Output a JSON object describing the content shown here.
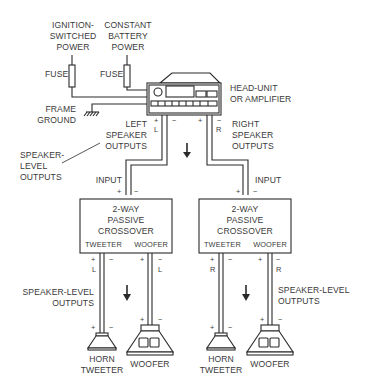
{
  "colors": {
    "line": "#2a2a2a",
    "text": "#3a3a3a",
    "background": "#ffffff"
  },
  "power": {
    "ignition": {
      "line1": "IGNITION-",
      "line2": "SWITCHED",
      "line3": "POWER",
      "fuse_label": "FUSE"
    },
    "constant": {
      "line1": "CONSTANT",
      "line2": "BATTERY",
      "line3": "POWER",
      "fuse_label": "FUSE"
    }
  },
  "ground": {
    "line1": "FRAME",
    "line2": "GROUND"
  },
  "head_unit": {
    "line1": "HEAD-UNIT",
    "line2": "OR AMPLIFIER"
  },
  "left_outputs": {
    "line1": "LEFT",
    "line2": "SPEAKER",
    "line3": "OUTPUTS",
    "plus": "+",
    "minus": "−",
    "channel": "L"
  },
  "right_outputs": {
    "line1": "RIGHT",
    "line2": "SPEAKER",
    "line3": "OUTPUTS",
    "plus": "+",
    "minus": "−",
    "channel": "R"
  },
  "speaker_level_callout": {
    "line1": "SPEAKER-",
    "line2": "LEVEL",
    "line3": "OUTPUTS"
  },
  "crossovers": [
    {
      "input_label": "INPUT",
      "plus": "+",
      "minus": "−",
      "line1": "2-WAY",
      "line2": "PASSIVE",
      "line3": "CROSSOVER",
      "tweeter": "TWEETER",
      "woofer": "WOOFER",
      "channel": "L"
    },
    {
      "input_label": "INPUT",
      "plus": "+",
      "minus": "−",
      "line1": "2-WAY",
      "line2": "PASSIVE",
      "line3": "CROSSOVER",
      "tweeter": "TWEETER",
      "woofer": "WOOFER",
      "channel": "R"
    }
  ],
  "bottom_outputs": {
    "left": {
      "line1": "SPEAKER-LEVEL",
      "line2": "OUTPUTS"
    },
    "right": {
      "line1": "SPEAKER-LEVEL",
      "line2": "OUTPUTS"
    }
  },
  "speakers": [
    {
      "type": "horn-tweeter",
      "line1": "HORN",
      "line2": "TWEETER",
      "plus": "+",
      "minus": "−"
    },
    {
      "type": "woofer",
      "line1": "WOOFER",
      "plus": "+",
      "minus": "−"
    },
    {
      "type": "horn-tweeter",
      "line1": "HORN",
      "line2": "TWEETER",
      "plus": "+",
      "minus": "−"
    },
    {
      "type": "woofer",
      "line1": "WOOFER",
      "plus": "+",
      "minus": "−"
    }
  ]
}
